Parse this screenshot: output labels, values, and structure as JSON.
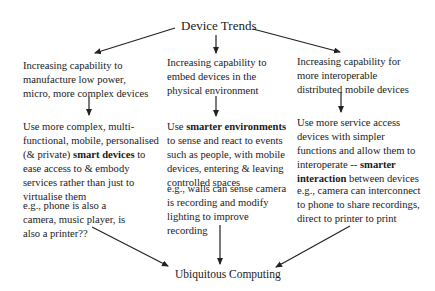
{
  "title": "Device Trends",
  "bottom": "Ubiquitous Computing",
  "columns": [
    {
      "trend": [
        "Increasing capability to",
        "manufacture low power,",
        "micro, more complex devices"
      ],
      "approach": {
        "line1": "Use more complex, multi-",
        "line2": "functional, mobile, personalised",
        "line3_pre": "(& private) ",
        "line3_bold": "smart devices",
        "line3_post": " to",
        "line4": "ease access to & embody",
        "line5": "services rather than just to",
        "line6": "virtualise them"
      },
      "example": [
        "e.g., phone is also a",
        "camera, music player, is",
        "also a printer??"
      ]
    },
    {
      "trend": [
        "Increasing capability to",
        "embed devices in the",
        "physical environment"
      ],
      "approach": {
        "line1_pre": "Use ",
        "line1_bold": "smarter environments",
        "line2": "to sense and react to events",
        "line3": "such as people, with mobile",
        "line4": "devices, entering & leaving",
        "line5": "controlled spaces"
      },
      "example": [
        "e.g., walls can sense camera",
        "is recording and modify",
        "lighting to improve",
        "recording"
      ]
    },
    {
      "trend": [
        "Increasing capability for",
        "more interoperable",
        "distributed mobile devices"
      ],
      "approach": {
        "line1": "Use more service access",
        "line2": "devices with simpler",
        "line3": "functions and allow them to",
        "line4_pre": "interoperate -- ",
        "line4_bold": "smarter",
        "line5_bold": "interaction",
        "line5_post": " between devices"
      },
      "example": [
        "e.g., camera can interconnect",
        "to phone to share recordings,",
        "direct to printer to print"
      ]
    }
  ],
  "colors": {
    "text": "#1a1a1a",
    "arrow": "#222222",
    "background": "#ffffff"
  }
}
